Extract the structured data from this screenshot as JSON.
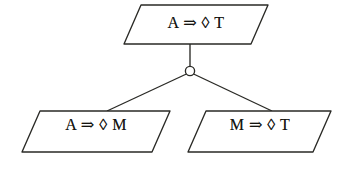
{
  "diagram": {
    "type": "proof-tree",
    "background_color": "#ffffff",
    "stroke_color": "#2a2a26",
    "text_color": "#14140f",
    "junction": {
      "shape": "open-circle",
      "label": "and-junction",
      "cx": 190,
      "cy": 71,
      "r": 4.6
    },
    "nodes": [
      {
        "id": "root",
        "role": "goal",
        "text": "A ⇒ ◊ T",
        "antecedent": "A",
        "operator": "⇒",
        "modality": "◊",
        "consequent": "T",
        "shape": "parallelogram"
      },
      {
        "id": "left",
        "role": "subgoal",
        "text": "A ⇒ ◊ M",
        "antecedent": "A",
        "operator": "⇒",
        "modality": "◊",
        "consequent": "M",
        "shape": "parallelogram"
      },
      {
        "id": "right",
        "role": "subgoal",
        "text": "M ⇒ ◊ T",
        "antecedent": "M",
        "operator": "⇒",
        "modality": "◊",
        "consequent": "T",
        "shape": "parallelogram"
      }
    ],
    "edges": [
      {
        "from": "root",
        "to": "junction",
        "style": "solid-vertical"
      },
      {
        "from": "junction",
        "to": "left",
        "style": "solid-diagonal"
      },
      {
        "from": "junction",
        "to": "right",
        "style": "solid-diagonal"
      }
    ]
  }
}
